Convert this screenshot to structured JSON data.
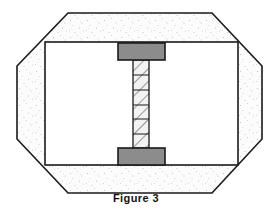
{
  "figure": {
    "caption": "Figure 3",
    "title": "Figure 3",
    "canvas": {
      "width": 272,
      "height": 213
    },
    "colors": {
      "outline": "#1a1a1a",
      "background": "#ffffff",
      "stipple_fill": "#fcfcfc",
      "stipple_dot": "#b9b9c4",
      "void_fill": "#ffffff",
      "flange_fill": "#8c8c8c",
      "flange_stroke": "#1a1a1a",
      "web_fill": "#f2f2f2",
      "web_hatch": "#4d4d4d",
      "caption_color": "#111111"
    },
    "shapes": {
      "soil_octagon": {
        "name": "soil-mass",
        "points": "68,13 212,13 262,66 262,139 212,193 68,193 17,139 17,66"
      },
      "void_rect": {
        "name": "excavation-void",
        "x": 45,
        "y": 42,
        "width": 193,
        "height": 123
      },
      "top_flange": {
        "name": "top-flange",
        "x": 118,
        "y": 43,
        "width": 47,
        "height": 17
      },
      "bottom_flange": {
        "name": "bottom-flange",
        "x": 118,
        "y": 148,
        "width": 47,
        "height": 17
      },
      "web_column": {
        "name": "web-column",
        "x": 133,
        "y": 60,
        "width": 16,
        "height": 88,
        "segment_dividers": [
          75,
          90,
          105,
          119,
          134
        ]
      }
    }
  }
}
